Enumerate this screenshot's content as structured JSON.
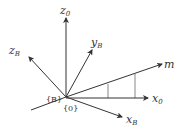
{
  "diagram": {
    "title": "",
    "origin": {
      "x": 66,
      "y": 97
    },
    "colors": {
      "line": "#333333",
      "background": "#ffffff"
    },
    "axes": [
      {
        "id": "z0",
        "base": "z",
        "sub": "0",
        "end": {
          "x": 66,
          "y": 18
        },
        "label_pos": {
          "x": 60,
          "y": 12
        }
      },
      {
        "id": "yB",
        "base": "y",
        "sub": "B",
        "end": {
          "x": 92,
          "y": 50
        },
        "label_pos": {
          "x": 92,
          "y": 45
        }
      },
      {
        "id": "zB",
        "base": "z",
        "sub": "B",
        "end": {
          "x": 29,
          "y": 57
        },
        "label_pos": {
          "x": 9,
          "y": 52
        }
      },
      {
        "id": "m",
        "base": "m",
        "sub": "",
        "end": {
          "x": 162,
          "y": 64
        },
        "label_pos": {
          "x": 164,
          "y": 67
        }
      },
      {
        "id": "x0",
        "base": "x",
        "sub": "0",
        "end": {
          "x": 148,
          "y": 98
        },
        "label_pos": {
          "x": 152,
          "y": 102
        }
      },
      {
        "id": "xB",
        "base": "x",
        "sub": "B",
        "end": {
          "x": 122,
          "y": 117
        },
        "label_pos": {
          "x": 127,
          "y": 123
        }
      }
    ],
    "labels": {
      "z0": {
        "base": "z",
        "sub": "0"
      },
      "yB": {
        "base": "y",
        "sub": "B"
      },
      "zB": {
        "base": "z",
        "sub": "B"
      },
      "m": {
        "base": "m"
      },
      "x0": {
        "base": "x",
        "sub": "0"
      },
      "xB": {
        "base": "x",
        "sub": "B"
      },
      "frame_B": "{B}",
      "frame_0": "{0}"
    }
  }
}
